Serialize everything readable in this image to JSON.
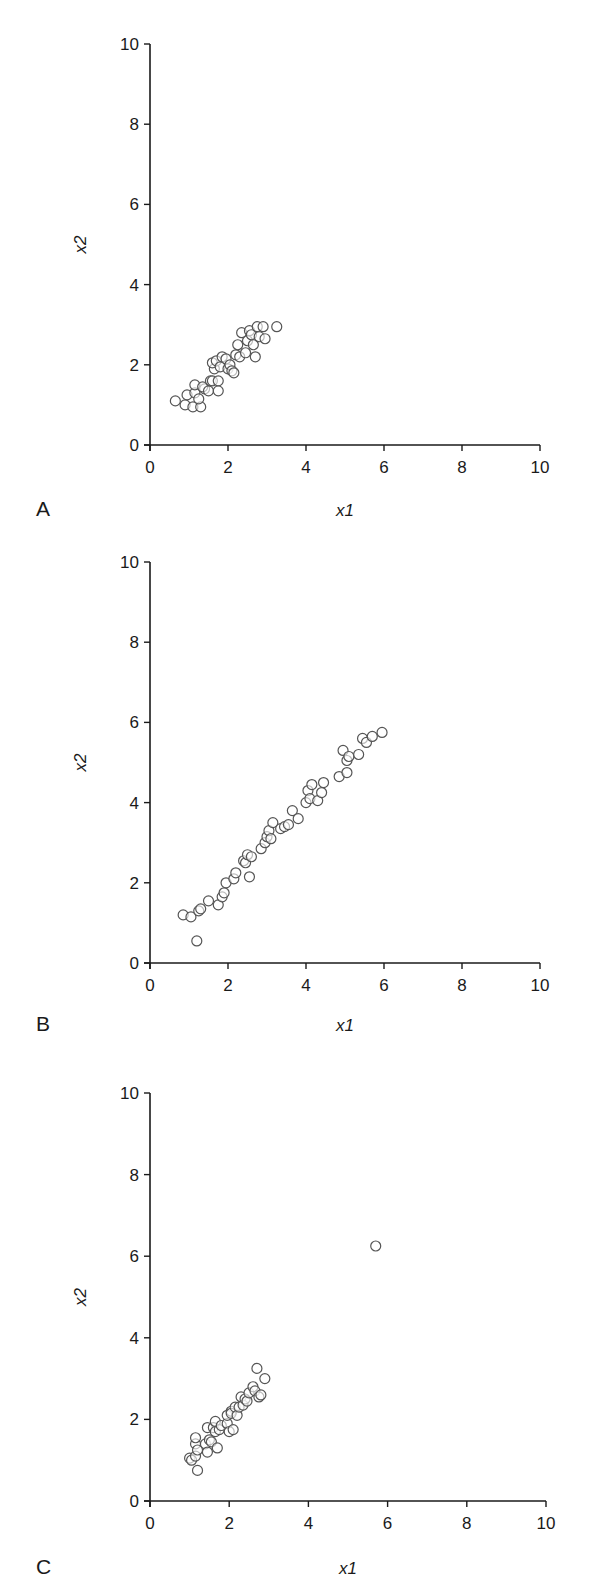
{
  "chart_data": [
    {
      "type": "scatter",
      "panel_label": "A",
      "title": "",
      "xlabel": "x1",
      "ylabel": "x2",
      "xlim": [
        0,
        10
      ],
      "ylim": [
        0,
        10
      ],
      "xticks": [
        0,
        2,
        4,
        6,
        8,
        10
      ],
      "yticks": [
        0,
        2,
        4,
        6,
        8,
        10
      ],
      "grid": false,
      "marker": "open-circle",
      "points": [
        [
          0.65,
          1.1
        ],
        [
          0.9,
          1.0
        ],
        [
          0.95,
          1.25
        ],
        [
          1.1,
          0.95
        ],
        [
          1.15,
          1.3
        ],
        [
          1.15,
          1.5
        ],
        [
          1.3,
          0.95
        ],
        [
          1.25,
          1.15
        ],
        [
          1.4,
          1.4
        ],
        [
          1.35,
          1.45
        ],
        [
          1.5,
          1.35
        ],
        [
          1.55,
          1.6
        ],
        [
          1.6,
          1.6
        ],
        [
          1.65,
          1.9
        ],
        [
          1.6,
          2.05
        ],
        [
          1.7,
          2.1
        ],
        [
          1.75,
          1.6
        ],
        [
          1.75,
          1.35
        ],
        [
          1.8,
          1.95
        ],
        [
          1.85,
          2.2
        ],
        [
          1.95,
          2.15
        ],
        [
          2.0,
          1.9
        ],
        [
          2.05,
          2.0
        ],
        [
          2.1,
          1.85
        ],
        [
          2.15,
          1.8
        ],
        [
          2.2,
          2.25
        ],
        [
          2.25,
          2.5
        ],
        [
          2.3,
          2.2
        ],
        [
          2.35,
          2.8
        ],
        [
          2.45,
          2.3
        ],
        [
          2.5,
          2.6
        ],
        [
          2.55,
          2.85
        ],
        [
          2.6,
          2.75
        ],
        [
          2.65,
          2.5
        ],
        [
          2.7,
          2.2
        ],
        [
          2.75,
          2.95
        ],
        [
          2.8,
          2.7
        ],
        [
          2.9,
          2.95
        ],
        [
          2.95,
          2.65
        ],
        [
          3.25,
          2.95
        ]
      ]
    },
    {
      "type": "scatter",
      "panel_label": "B",
      "title": "",
      "xlabel": "x1",
      "ylabel": "x2",
      "xlim": [
        0,
        10
      ],
      "ylim": [
        0,
        10
      ],
      "xticks": [
        0,
        2,
        4,
        6,
        8,
        10
      ],
      "yticks": [
        0,
        2,
        4,
        6,
        8,
        10
      ],
      "grid": false,
      "marker": "open-circle",
      "points": [
        [
          0.85,
          1.2
        ],
        [
          1.05,
          1.15
        ],
        [
          1.25,
          1.3
        ],
        [
          1.3,
          1.35
        ],
        [
          1.5,
          1.55
        ],
        [
          1.2,
          0.55
        ],
        [
          1.75,
          1.45
        ],
        [
          1.85,
          1.65
        ],
        [
          1.9,
          1.75
        ],
        [
          1.95,
          2.0
        ],
        [
          2.15,
          2.1
        ],
        [
          2.2,
          2.25
        ],
        [
          2.4,
          2.55
        ],
        [
          2.45,
          2.5
        ],
        [
          2.5,
          2.7
        ],
        [
          2.55,
          2.15
        ],
        [
          2.6,
          2.65
        ],
        [
          2.85,
          2.85
        ],
        [
          2.95,
          3.0
        ],
        [
          3.0,
          3.15
        ],
        [
          3.05,
          3.3
        ],
        [
          3.1,
          3.1
        ],
        [
          3.15,
          3.5
        ],
        [
          3.35,
          3.35
        ],
        [
          3.45,
          3.4
        ],
        [
          3.55,
          3.45
        ],
        [
          3.65,
          3.8
        ],
        [
          3.8,
          3.6
        ],
        [
          4.0,
          4.0
        ],
        [
          4.05,
          4.3
        ],
        [
          4.1,
          4.1
        ],
        [
          4.15,
          4.45
        ],
        [
          4.3,
          4.05
        ],
        [
          4.4,
          4.25
        ],
        [
          4.45,
          4.5
        ],
        [
          4.85,
          4.65
        ],
        [
          4.95,
          5.3
        ],
        [
          5.05,
          5.05
        ],
        [
          5.1,
          5.15
        ],
        [
          5.05,
          4.75
        ],
        [
          5.35,
          5.2
        ],
        [
          5.45,
          5.6
        ],
        [
          5.55,
          5.5
        ],
        [
          5.7,
          5.65
        ],
        [
          5.95,
          5.75
        ]
      ]
    },
    {
      "type": "scatter",
      "panel_label": "C",
      "title": "",
      "xlabel": "x1",
      "ylabel": "x2",
      "xlim": [
        0,
        10
      ],
      "ylim": [
        0,
        10
      ],
      "xticks": [
        0,
        2,
        4,
        6,
        8,
        10
      ],
      "yticks": [
        0,
        2,
        4,
        6,
        8,
        10
      ],
      "grid": false,
      "marker": "open-circle",
      "points": [
        [
          1.0,
          1.05
        ],
        [
          1.05,
          1.0
        ],
        [
          1.15,
          1.1
        ],
        [
          1.15,
          1.4
        ],
        [
          1.15,
          1.55
        ],
        [
          1.2,
          1.25
        ],
        [
          1.2,
          0.75
        ],
        [
          1.4,
          1.4
        ],
        [
          1.45,
          1.8
        ],
        [
          1.45,
          1.2
        ],
        [
          1.5,
          1.5
        ],
        [
          1.55,
          1.45
        ],
        [
          1.6,
          1.8
        ],
        [
          1.65,
          1.7
        ],
        [
          1.65,
          1.95
        ],
        [
          1.7,
          1.3
        ],
        [
          1.75,
          1.75
        ],
        [
          1.8,
          1.85
        ],
        [
          1.95,
          1.9
        ],
        [
          1.95,
          2.1
        ],
        [
          2.0,
          1.7
        ],
        [
          2.05,
          2.2
        ],
        [
          2.05,
          2.15
        ],
        [
          2.1,
          1.75
        ],
        [
          2.15,
          2.3
        ],
        [
          2.2,
          2.1
        ],
        [
          2.25,
          2.3
        ],
        [
          2.3,
          2.55
        ],
        [
          2.35,
          2.35
        ],
        [
          2.4,
          2.5
        ],
        [
          2.45,
          2.45
        ],
        [
          2.5,
          2.65
        ],
        [
          2.6,
          2.8
        ],
        [
          2.65,
          2.7
        ],
        [
          2.7,
          3.25
        ],
        [
          2.75,
          2.55
        ],
        [
          2.8,
          2.6
        ],
        [
          2.9,
          3.0
        ],
        [
          5.7,
          6.25
        ]
      ]
    }
  ],
  "panels": [
    {
      "letter": "A",
      "xlabel": "x1",
      "ylabel": "x2",
      "yticks": [
        "0",
        "2",
        "4",
        "6",
        "8",
        "10"
      ],
      "xticks": [
        "0",
        "2",
        "4",
        "6",
        "8",
        "10"
      ]
    },
    {
      "letter": "B",
      "xlabel": "x1",
      "ylabel": "x2",
      "yticks": [
        "0",
        "2",
        "4",
        "6",
        "8",
        "10"
      ],
      "xticks": [
        "0",
        "2",
        "4",
        "6",
        "8",
        "10"
      ]
    },
    {
      "letter": "C",
      "xlabel": "x1",
      "ylabel": "x2",
      "yticks": [
        "0",
        "2",
        "4",
        "6",
        "8",
        "10"
      ],
      "xticks": [
        "0",
        "2",
        "4",
        "6",
        "8",
        "10"
      ]
    }
  ],
  "style": {
    "axis_color": "#1a1a1a",
    "marker_stroke": "#555555",
    "marker_fill": "#ffffff",
    "background": "#ffffff"
  }
}
